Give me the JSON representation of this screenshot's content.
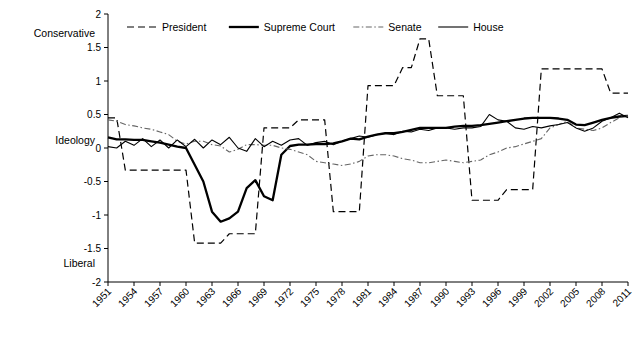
{
  "chart_data": {
    "type": "line",
    "title": "",
    "xlabel": "",
    "ylabel": "",
    "ylim": [
      -2,
      2
    ],
    "xlim": [
      1951,
      2011
    ],
    "grid": false,
    "legend_position": "top-inside",
    "y_ticks": [
      -2,
      -1.5,
      -1,
      -0.5,
      0,
      0.5,
      1,
      1.5,
      2
    ],
    "y_tick_labels": [
      "-2",
      "-1.5",
      "-1",
      "-0.5",
      "0",
      "0.5",
      "1",
      "1.5",
      "2"
    ],
    "y_annotations": [
      {
        "label": "Conservative",
        "value": 1.72
      },
      {
        "label": "Ideology",
        "value": 0.12
      },
      {
        "label": "Liberal",
        "value": -1.72
      }
    ],
    "x_ticks": [
      1951,
      1954,
      1957,
      1960,
      1963,
      1966,
      1969,
      1972,
      1975,
      1978,
      1981,
      1984,
      1987,
      1990,
      1993,
      1996,
      1999,
      2002,
      2005,
      2008,
      2011
    ],
    "x_tick_labels": [
      "1951",
      "1954",
      "1957",
      "1960",
      "1963",
      "1966",
      "1969",
      "1972",
      "1975",
      "1978",
      "1981",
      "1984",
      "1987",
      "1990",
      "1993",
      "1996",
      "1999",
      "2002",
      "2005",
      "2008",
      "2011"
    ],
    "series": [
      {
        "name": "President",
        "style": "dashed",
        "color": "#000000",
        "width": 1.2,
        "x": [
          1951,
          1952,
          1953,
          1954,
          1955,
          1956,
          1957,
          1958,
          1959,
          1960,
          1961,
          1962,
          1963,
          1964,
          1965,
          1966,
          1967,
          1968,
          1969,
          1970,
          1971,
          1972,
          1973,
          1974,
          1975,
          1976,
          1977,
          1978,
          1979,
          1980,
          1981,
          1982,
          1983,
          1984,
          1985,
          1986,
          1987,
          1988,
          1989,
          1990,
          1991,
          1992,
          1993,
          1994,
          1995,
          1996,
          1997,
          1998,
          1999,
          2000,
          2001,
          2002,
          2003,
          2004,
          2005,
          2006,
          2007,
          2008,
          2009,
          2010,
          2011
        ],
        "y": [
          0.45,
          0.45,
          -0.33,
          -0.33,
          -0.33,
          -0.33,
          -0.33,
          -0.33,
          -0.33,
          -0.33,
          -1.42,
          -1.42,
          -1.42,
          -1.42,
          -1.28,
          -1.28,
          -1.28,
          -1.28,
          0.3,
          0.3,
          0.3,
          0.3,
          0.42,
          0.42,
          0.42,
          0.42,
          -0.95,
          -0.95,
          -0.95,
          -0.95,
          0.93,
          0.93,
          0.93,
          0.93,
          1.2,
          1.2,
          1.63,
          1.63,
          0.78,
          0.78,
          0.78,
          0.78,
          -0.78,
          -0.78,
          -0.78,
          -0.78,
          -0.62,
          -0.62,
          -0.62,
          -0.62,
          1.18,
          1.18,
          1.18,
          1.18,
          1.18,
          1.18,
          1.18,
          1.18,
          0.82,
          0.82,
          0.82
        ]
      },
      {
        "name": "Supreme Court",
        "style": "solid-bold",
        "color": "#000000",
        "width": 2.3,
        "x": [
          1951,
          1952,
          1953,
          1954,
          1955,
          1956,
          1957,
          1958,
          1959,
          1960,
          1961,
          1962,
          1963,
          1964,
          1965,
          1966,
          1967,
          1968,
          1969,
          1970,
          1971,
          1972,
          1973,
          1974,
          1975,
          1976,
          1977,
          1978,
          1979,
          1980,
          1981,
          1982,
          1983,
          1984,
          1985,
          1986,
          1987,
          1988,
          1989,
          1990,
          1991,
          1992,
          1993,
          1994,
          1995,
          1996,
          1997,
          1998,
          1999,
          2000,
          2001,
          2002,
          2003,
          2004,
          2005,
          2006,
          2007,
          2008,
          2009,
          2010,
          2011
        ],
        "y": [
          0.16,
          0.13,
          0.13,
          0.12,
          0.12,
          0.1,
          0.08,
          0.05,
          0.02,
          0.0,
          -0.25,
          -0.5,
          -0.95,
          -1.1,
          -1.05,
          -0.95,
          -0.6,
          -0.48,
          -0.72,
          -0.78,
          -0.1,
          0.03,
          0.05,
          0.05,
          0.06,
          0.06,
          0.07,
          0.1,
          0.14,
          0.13,
          0.17,
          0.2,
          0.22,
          0.22,
          0.24,
          0.27,
          0.3,
          0.3,
          0.3,
          0.3,
          0.32,
          0.33,
          0.33,
          0.34,
          0.36,
          0.38,
          0.4,
          0.42,
          0.44,
          0.45,
          0.45,
          0.45,
          0.44,
          0.42,
          0.35,
          0.34,
          0.38,
          0.42,
          0.45,
          0.47,
          0.48
        ]
      },
      {
        "name": "Senate",
        "style": "dashdot",
        "color": "#666666",
        "width": 1.1,
        "x": [
          1951,
          1952,
          1953,
          1954,
          1955,
          1956,
          1957,
          1958,
          1959,
          1960,
          1961,
          1962,
          1963,
          1964,
          1965,
          1966,
          1967,
          1968,
          1969,
          1970,
          1971,
          1972,
          1973,
          1974,
          1975,
          1976,
          1977,
          1978,
          1979,
          1980,
          1981,
          1982,
          1983,
          1984,
          1985,
          1986,
          1987,
          1988,
          1989,
          1990,
          1991,
          1992,
          1993,
          1994,
          1995,
          1996,
          1997,
          1998,
          1999,
          2000,
          2001,
          2002,
          2003,
          2004,
          2005,
          2006,
          2007,
          2008,
          2009,
          2010,
          2011
        ],
        "y": [
          0.42,
          0.4,
          0.35,
          0.33,
          0.3,
          0.28,
          0.24,
          0.2,
          0.1,
          0.06,
          0.1,
          0.1,
          0.05,
          0.03,
          -0.06,
          -0.02,
          0.05,
          0.05,
          0.04,
          0.04,
          0.0,
          -0.02,
          -0.06,
          -0.1,
          -0.2,
          -0.22,
          -0.24,
          -0.26,
          -0.24,
          -0.2,
          -0.12,
          -0.1,
          -0.1,
          -0.12,
          -0.16,
          -0.18,
          -0.22,
          -0.22,
          -0.2,
          -0.18,
          -0.2,
          -0.22,
          -0.2,
          -0.18,
          -0.1,
          -0.06,
          0.0,
          0.02,
          0.06,
          0.1,
          0.14,
          0.3,
          0.35,
          0.4,
          0.3,
          0.28,
          0.26,
          0.3,
          0.38,
          0.45,
          0.48
        ]
      },
      {
        "name": "House",
        "style": "solid-thin",
        "color": "#000000",
        "width": 1.1,
        "x": [
          1951,
          1952,
          1953,
          1954,
          1955,
          1956,
          1957,
          1958,
          1959,
          1960,
          1961,
          1962,
          1963,
          1964,
          1965,
          1966,
          1967,
          1968,
          1969,
          1970,
          1971,
          1972,
          1973,
          1974,
          1975,
          1976,
          1977,
          1978,
          1979,
          1980,
          1981,
          1982,
          1983,
          1984,
          1985,
          1986,
          1987,
          1988,
          1989,
          1990,
          1991,
          1992,
          1993,
          1994,
          1995,
          1996,
          1997,
          1998,
          1999,
          2000,
          2001,
          2002,
          2003,
          2004,
          2005,
          2006,
          2007,
          2008,
          2009,
          2010,
          2011
        ],
        "y": [
          0.02,
          0.0,
          0.1,
          0.04,
          0.14,
          0.02,
          0.12,
          0.0,
          0.12,
          0.02,
          0.13,
          0.0,
          0.12,
          0.05,
          0.16,
          0.0,
          -0.05,
          0.14,
          0.02,
          0.1,
          0.04,
          0.12,
          0.14,
          0.04,
          0.08,
          0.1,
          0.05,
          0.1,
          0.14,
          0.18,
          0.16,
          0.2,
          0.22,
          0.2,
          0.25,
          0.24,
          0.28,
          0.26,
          0.3,
          0.3,
          0.28,
          0.3,
          0.3,
          0.32,
          0.5,
          0.42,
          0.4,
          0.3,
          0.28,
          0.32,
          0.3,
          0.33,
          0.35,
          0.38,
          0.3,
          0.25,
          0.3,
          0.4,
          0.45,
          0.52,
          0.45
        ]
      }
    ],
    "legend": [
      {
        "name": "President",
        "style": "dashed"
      },
      {
        "name": "Supreme Court",
        "style": "solid-bold"
      },
      {
        "name": "Senate",
        "style": "dashdot"
      },
      {
        "name": "House",
        "style": "solid-thin"
      }
    ]
  }
}
